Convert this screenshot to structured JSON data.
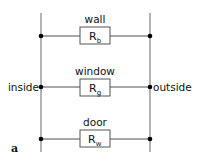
{
  "diagram": {
    "type": "parallel thermal resistance circuit",
    "figure_label": "a",
    "left_node_label": "inside",
    "right_node_label": "outside",
    "branches": [
      {
        "label": "wall",
        "resistor": "R",
        "subscript": "b"
      },
      {
        "label": "window",
        "resistor": "R",
        "subscript": "g"
      },
      {
        "label": "door",
        "resistor": "R",
        "subscript": "w"
      }
    ],
    "colors": {
      "line": "#8a8a8a",
      "node": "#000000",
      "text": "#111111",
      "box": "#555555"
    }
  }
}
